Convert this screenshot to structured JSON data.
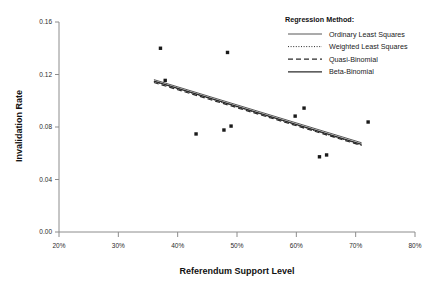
{
  "chart_data": {
    "type": "scatter",
    "title": "",
    "xlabel": "Referendum Support Level",
    "ylabel": "Invalidation Rate",
    "xlim": [
      20,
      80
    ],
    "ylim": [
      0.0,
      0.16
    ],
    "grid": false,
    "x_tick_labels": [
      "20%",
      "30%",
      "40%",
      "50%",
      "60%",
      "70%",
      "80%"
    ],
    "x_ticks": [
      20,
      30,
      40,
      50,
      60,
      70,
      80
    ],
    "y_tick_labels": [
      "0.00",
      "0.04",
      "0.08",
      "0.12",
      "0.16"
    ],
    "y_ticks": [
      0.0,
      0.04,
      0.08,
      0.12,
      0.16
    ],
    "legend_position": "top-right",
    "legend_title": "Regression Method:",
    "points": [
      {
        "x": 37.1,
        "y": 0.14
      },
      {
        "x": 37.9,
        "y": 0.1155
      },
      {
        "x": 43.1,
        "y": 0.0747
      },
      {
        "x": 47.8,
        "y": 0.0777
      },
      {
        "x": 48.4,
        "y": 0.1368
      },
      {
        "x": 49.0,
        "y": 0.0807
      },
      {
        "x": 59.8,
        "y": 0.0883
      },
      {
        "x": 61.3,
        "y": 0.0944
      },
      {
        "x": 63.9,
        "y": 0.0573
      },
      {
        "x": 65.1,
        "y": 0.0587
      },
      {
        "x": 72.1,
        "y": 0.0838
      }
    ],
    "series": [
      {
        "name": "Ordinary Least Squares",
        "style": "solid",
        "width": 0.8,
        "x": [
          36.0,
          71.0
        ],
        "values": [
          0.1161,
          0.068
        ]
      },
      {
        "name": "Weighted Least Squares",
        "style": "dotted",
        "width": 1.0,
        "x": [
          36.0,
          71.0
        ],
        "values": [
          0.1147,
          0.0663
        ]
      },
      {
        "name": "Quasi-Binomial",
        "style": "dashed",
        "width": 1.2,
        "x": [
          36.0,
          71.0
        ],
        "values": [
          0.1139,
          0.0659
        ]
      },
      {
        "name": "Beta-Binomial",
        "style": "solid",
        "width": 1.3,
        "x": [
          36.0,
          71.0
        ],
        "values": [
          0.115,
          0.0668
        ]
      }
    ],
    "colors": {
      "point": "#1a1a1a",
      "axis": "#8c8c8c",
      "text": "#111111",
      "line": "#2b2b2b"
    }
  }
}
